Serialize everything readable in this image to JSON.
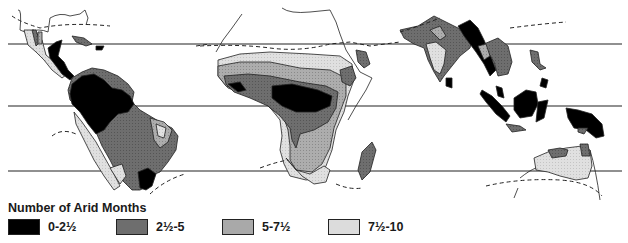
{
  "legend": {
    "title": "Number of Arid Months",
    "items": [
      {
        "label": "0-2½",
        "color": "#000000",
        "pattern": "solid"
      },
      {
        "label": "2½-5",
        "color": "#6e6e6e",
        "pattern": "dark-stipple"
      },
      {
        "label": "5-7½",
        "color": "#a9a9a9",
        "pattern": "medium-stipple"
      },
      {
        "label": "7½-10",
        "color": "#dcdcdc",
        "pattern": "light-stipple"
      }
    ]
  },
  "map": {
    "regions": [
      "Central & South America",
      "Africa & Madagascar",
      "South & Southeast Asia, Indonesia, New Guinea, Northern Australia"
    ],
    "latitude_lines_y": [
      44,
      106,
      171
    ],
    "boundary_style": "dashed line marks limit of tropical zone"
  }
}
